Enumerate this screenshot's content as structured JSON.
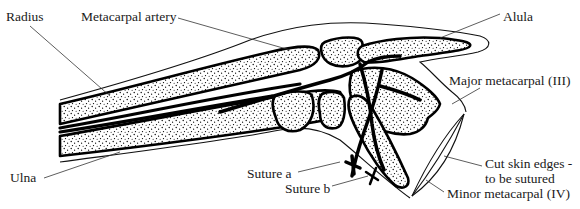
{
  "figure": {
    "type": "anatomical-diagram",
    "colors": {
      "ink": "#000000",
      "label_text": "#1a1a1a",
      "leader_line": "#333333",
      "background": "#ffffff"
    }
  },
  "labels": {
    "radius": "Radius",
    "metacarpal_artery": "Metacarpal artery",
    "alula": "Alula",
    "major_metacarpal": "Major metacarpal (III)",
    "ulna": "Ulna",
    "suture_a": "Suture a",
    "suture_b": "Suture b",
    "cut_skin_line1": "Cut skin edges -",
    "cut_skin_line2": "to be sutured",
    "minor_metacarpal": "Minor metacarpal (IV)"
  }
}
